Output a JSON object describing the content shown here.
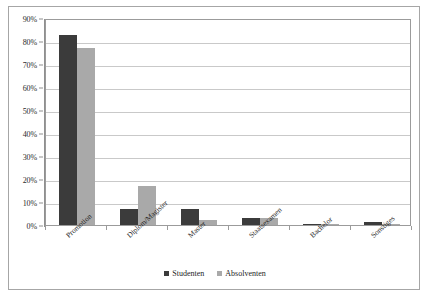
{
  "chart_data": {
    "type": "bar",
    "title": "",
    "subtitle": "",
    "xlabel": "",
    "ylabel": "",
    "ylim": [
      0,
      90
    ],
    "ytick_step": 10,
    "grid": true,
    "legend_position": "bottom",
    "categories": [
      "Promotion",
      "Diplom/Magister",
      "Master",
      "Staatsexamen",
      "Bachelor",
      "Sonstiges"
    ],
    "ytick_labels": [
      "0%",
      "10%",
      "20%",
      "30%",
      "40%",
      "50%",
      "60%",
      "70%",
      "80%",
      "90%"
    ],
    "ytick_values": [
      0,
      10,
      20,
      30,
      40,
      50,
      60,
      70,
      80,
      90
    ],
    "series": [
      {
        "name": "Studenten",
        "color": "#3b3b3b",
        "values": [
          82.5,
          7.0,
          7.0,
          3.0,
          0.5,
          1.2
        ]
      },
      {
        "name": "Absolventen",
        "color": "#a9a9a9",
        "values": [
          77.0,
          16.8,
          2.2,
          3.2,
          0.6,
          0.4
        ]
      }
    ]
  },
  "legend": {
    "items": [
      {
        "label": "Studenten",
        "color": "#3b3b3b"
      },
      {
        "label": "Absolventen",
        "color": "#a9a9a9"
      }
    ]
  }
}
